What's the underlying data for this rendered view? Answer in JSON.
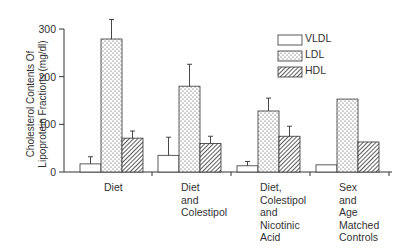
{
  "chart_data": {
    "type": "bar",
    "title": "",
    "ylabel": "Cholesterol Contents Of Lipoprotein Fractions (mg/dl)",
    "ylabel_lines": [
      "Cholesterol Contents Of",
      "Lipoprotein Fractions (mg/dl)"
    ],
    "xlabel": "",
    "ylim": [
      0,
      300
    ],
    "yticks": [
      0,
      100,
      200,
      300
    ],
    "grid": false,
    "legend_position": "upper right",
    "categories": [
      "Diet",
      "Diet and Colestipol",
      "Diet, Colestipol and Nicotinic Acid",
      "Sex and Age Matched Controls"
    ],
    "category_labels": [
      "Diet",
      "Diet\nand\nColestipol",
      "Diet,\nColestipol\nand\nNicotinic\nAcid",
      "Sex\nand\nAge\nMatched\nControls"
    ],
    "series": [
      {
        "name": "VLDL",
        "pattern": "open",
        "values": [
          17,
          35,
          13,
          15
        ],
        "error_upper": [
          32,
          73,
          22,
          null
        ]
      },
      {
        "name": "LDL",
        "pattern": "dotted",
        "values": [
          279,
          180,
          128,
          153
        ],
        "error_upper": [
          320,
          226,
          155,
          null
        ]
      },
      {
        "name": "HDL",
        "pattern": "hatched",
        "values": [
          71,
          60,
          75,
          63
        ],
        "error_upper": [
          86,
          75,
          96,
          null
        ]
      }
    ]
  }
}
